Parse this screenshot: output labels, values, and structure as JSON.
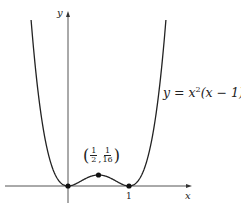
{
  "chart_data": {
    "type": "line",
    "title": "",
    "function": "y = x^2(x - 1)^2",
    "xlabel": "x",
    "ylabel": "y",
    "x_ticks": [
      {
        "value": 1,
        "label": "1"
      }
    ],
    "xlim": [
      -1.05,
      2.02
    ],
    "ylim": [
      -0.1,
      1.0
    ],
    "grid": false,
    "legend": null,
    "series": [
      {
        "name": "y = x^2(x - 1)^2",
        "x": [
          -0.6,
          -0.5,
          -0.4,
          -0.3,
          -0.2,
          -0.1,
          0,
          0.1,
          0.2,
          0.3,
          0.4,
          0.5,
          0.6,
          0.7,
          0.8,
          0.9,
          1.0,
          1.1,
          1.2,
          1.3,
          1.4,
          1.5,
          1.6
        ],
        "y": [
          0.9216,
          0.5625,
          0.3136,
          0.1521,
          0.0576,
          0.0121,
          0,
          0.0081,
          0.0256,
          0.0441,
          0.0576,
          0.0625,
          0.0576,
          0.0441,
          0.0256,
          0.0081,
          0,
          0.0121,
          0.0576,
          0.1521,
          0.3136,
          0.5625,
          0.9216
        ]
      }
    ],
    "marked_points": [
      {
        "x": 0,
        "y": 0,
        "label": ""
      },
      {
        "x": 0.5,
        "y": 0.0625,
        "label": "(1/2, 1/16)"
      },
      {
        "x": 1,
        "y": 0,
        "label": ""
      }
    ],
    "annotations": [
      {
        "text": "y = x^2(x - 1)^2",
        "position": "right of curve"
      },
      {
        "text": "(1/2, 1/16)",
        "position": "above local maximum"
      }
    ]
  },
  "labels": {
    "y_axis": "y",
    "x_axis": "x",
    "tick_one": "1",
    "eq_y": "y = x",
    "eq_exp1": "2",
    "eq_mid": "(x − 1)",
    "eq_exp2": "2",
    "pt_open": "(",
    "pt_n1": "1",
    "pt_d1": "2",
    "pt_comma": ",",
    "pt_n2": "1",
    "pt_d2": "16",
    "pt_close": ")"
  },
  "style": {
    "curve_color": "#222222",
    "axis_color": "#555555",
    "point_color": "#111111"
  }
}
